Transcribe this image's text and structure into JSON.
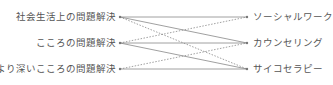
{
  "diagram": {
    "left_nodes": [
      {
        "label": "社会生活上の問題解決",
        "y": 17
      },
      {
        "label": "こころの問題解決",
        "y": 43
      },
      {
        "label": "より深いこころの問題解決",
        "y": 69
      }
    ],
    "right_nodes": [
      {
        "label": "ソーシャルワーク",
        "y": 17
      },
      {
        "label": "カウンセリング",
        "y": 43
      },
      {
        "label": "サイコセラピー",
        "y": 69
      }
    ],
    "connections": [
      {
        "from": 0,
        "to": 0,
        "style": "solid"
      },
      {
        "from": 0,
        "to": 1,
        "style": "solid"
      },
      {
        "from": 0,
        "to": 2,
        "style": "dotted"
      },
      {
        "from": 1,
        "to": 0,
        "style": "dotted"
      },
      {
        "from": 1,
        "to": 1,
        "style": "solid"
      },
      {
        "from": 1,
        "to": 2,
        "style": "solid"
      },
      {
        "from": 2,
        "to": 1,
        "style": "dotted"
      },
      {
        "from": 2,
        "to": 2,
        "style": "solid"
      }
    ],
    "line_color": "#888888"
  }
}
